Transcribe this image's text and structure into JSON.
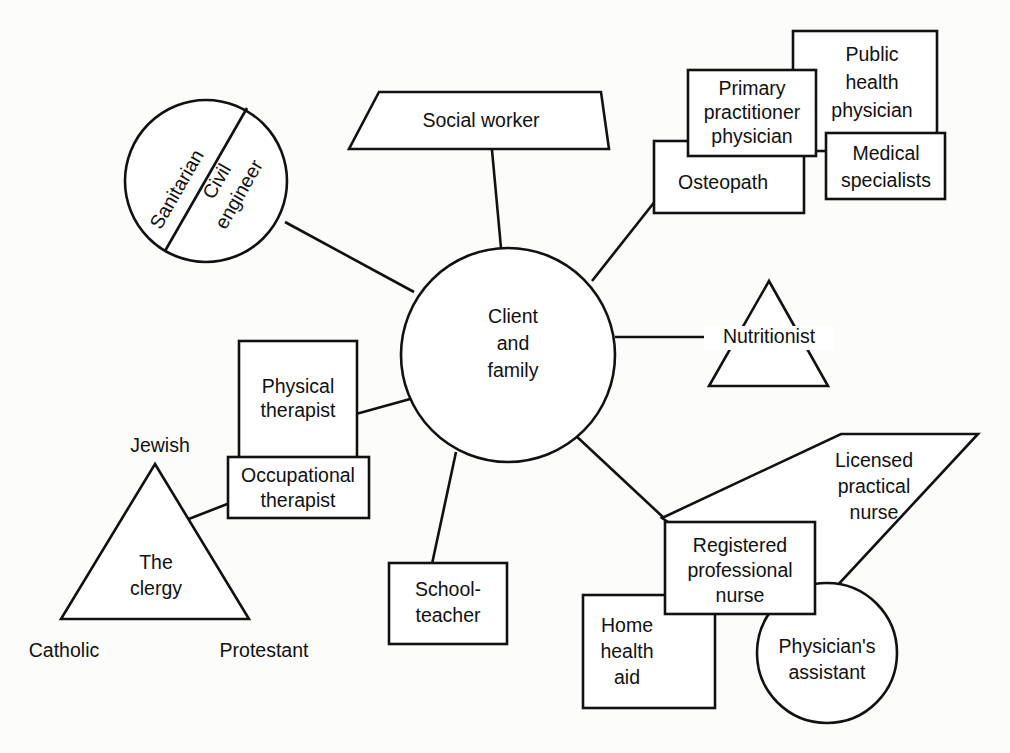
{
  "diagram": {
    "type": "node-link-diagram",
    "stroke_color": "#111111",
    "fill_color": "#ffffff",
    "background_color": "#fcfcfa",
    "center": {
      "name": "client-and-family",
      "shape": "circle",
      "lines": [
        "Client",
        "and",
        "family"
      ]
    },
    "nodes": {
      "sanitarian": {
        "label": "Sanitarian",
        "shape": "circle-half"
      },
      "civil_engineer": {
        "line1": "Civil",
        "line2": "engineer",
        "shape": "circle-half"
      },
      "social_worker": {
        "label": "Social worker",
        "shape": "trapezoid"
      },
      "primary_practitioner": {
        "line1": "Primary",
        "line2": "practitioner",
        "line3": "physician",
        "shape": "rect"
      },
      "public_health": {
        "line1": "Public",
        "line2": "health",
        "line3": "physician",
        "shape": "rect"
      },
      "medical_specialists": {
        "line1": "Medical",
        "line2": "specialists",
        "shape": "rect"
      },
      "osteopath": {
        "label": "Osteopath",
        "shape": "rect"
      },
      "nutritionist": {
        "label": "Nutritionist",
        "shape": "triangle"
      },
      "physical_therapist": {
        "line1": "Physical",
        "line2": "therapist",
        "shape": "rect"
      },
      "occupational_therapist": {
        "line1": "Occupational",
        "line2": "therapist",
        "shape": "rect"
      },
      "clergy": {
        "line1": "The",
        "line2": "clergy",
        "shape": "triangle",
        "vertex_top": "Jewish",
        "vertex_left": "Catholic",
        "vertex_right": "Protestant"
      },
      "schoolteacher": {
        "line1": "School-",
        "line2": "teacher",
        "shape": "rect"
      },
      "registered_nurse": {
        "line1": "Registered",
        "line2": "professional",
        "line3": "nurse",
        "shape": "rect"
      },
      "licensed_practical_nurse": {
        "line1": "Licensed",
        "line2": "practical",
        "line3": "nurse",
        "shape": "parallelogram"
      },
      "home_health_aid": {
        "line1": "Home",
        "line2": "health",
        "line3": "aid",
        "shape": "rect"
      },
      "physicians_assistant": {
        "line1": "Physician's",
        "line2": "assistant",
        "shape": "circle"
      }
    },
    "connections": [
      {
        "from": "client-and-family",
        "to": "sanitarian-civil-engineer-circle"
      },
      {
        "from": "client-and-family",
        "to": "social-worker"
      },
      {
        "from": "client-and-family",
        "to": "osteopath"
      },
      {
        "from": "client-and-family",
        "to": "nutritionist"
      },
      {
        "from": "client-and-family",
        "to": "physical-therapist"
      },
      {
        "from": "client-and-family",
        "to": "schoolteacher"
      },
      {
        "from": "client-and-family",
        "to": "registered-professional-nurse"
      },
      {
        "from": "occupational-therapist",
        "to": "clergy-triangle"
      }
    ]
  }
}
